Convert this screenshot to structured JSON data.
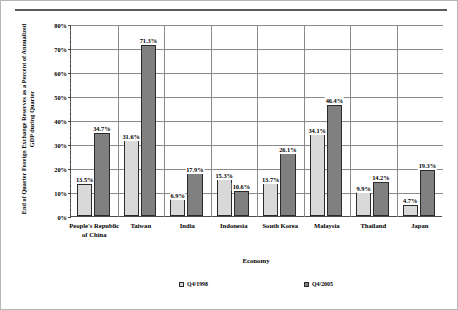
{
  "chart_data": {
    "type": "bar",
    "title": "",
    "xlabel": "Economy",
    "ylabel": "End of Quarter Foreign Exchange Reserves as a Percent of Annualized GDP during Quarter",
    "ylim": [
      0,
      80
    ],
    "ytick_labels": [
      "0%",
      "10%",
      "20%",
      "30%",
      "40%",
      "50%",
      "60%",
      "70%",
      "80%"
    ],
    "ytick_values": [
      0,
      10,
      20,
      30,
      40,
      50,
      60,
      70,
      80
    ],
    "grid": "horizontal-and-category-separators",
    "legend_position": "bottom",
    "categories": [
      "People's Republic of China",
      "Taiwan",
      "India",
      "Indonesia",
      "South Korea",
      "Malaysia",
      "Thailand",
      "Japan"
    ],
    "series": [
      {
        "name": "Q4/1998",
        "color": "#d9d9d9",
        "values": [
          13.5,
          31.6,
          6.9,
          15.3,
          13.7,
          34.1,
          9.9,
          4.7
        ],
        "labels": [
          "13.5%",
          "31.6%",
          "6.9%",
          "15.3%",
          "13.7%",
          "34.1%",
          "9.9%",
          "4.7%"
        ]
      },
      {
        "name": "Q4/2005",
        "color": "#808080",
        "values": [
          34.7,
          71.3,
          17.9,
          10.6,
          26.1,
          46.4,
          14.2,
          19.3
        ],
        "labels": [
          "34.7%",
          "71.3%",
          "17.9%",
          "10.6%",
          "26.1%",
          "46.4%",
          "14.2%",
          "19.3%"
        ]
      }
    ]
  },
  "figure": {
    "background": "#ffffff",
    "axis_color": "#4a4a4a",
    "grid_color": "#8b8b8b",
    "bar_outline": "#2b2b2b"
  }
}
